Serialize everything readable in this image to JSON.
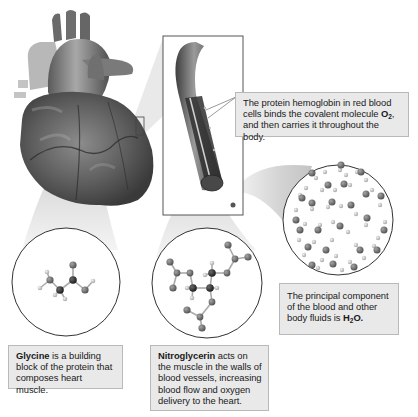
{
  "diagram": {
    "title": "",
    "illustrations": {
      "heart": "heart-illustration",
      "blood_vessel_inset": "blood-vessel-cutaway",
      "zoom_marker": "heart-zoom-marker"
    },
    "callouts": {
      "hemoglobin": {
        "line1": "The protein hemoglobin in red blood",
        "line2_pre": "cells binds the covalent molecule ",
        "molecule": "O",
        "molecule_sub": "2",
        "line2_post": ",",
        "line3": "and then carries it throughout the body."
      },
      "water": {
        "line1": "The principal component",
        "line2": "of the blood and other",
        "line3_pre": "body fluids is ",
        "molecule_a": "H",
        "molecule_sub": "2",
        "molecule_b": "O."
      },
      "glycine": {
        "term": "Glycine",
        "line1_post": " is a building",
        "line2": "block of the protein that",
        "line3": "composes heart muscle."
      },
      "nitroglycerin": {
        "term": "Nitroglycerin",
        "line1_post": " acts on",
        "line2": "the muscle in the walls of",
        "line3": "blood vessels, increasing",
        "line4": "blood flow and oxygen",
        "line5": "delivery to the heart."
      }
    },
    "molecule_views": [
      {
        "name": "glycine",
        "center": [
          66,
          282
        ],
        "radius": 54
      },
      {
        "name": "nitroglycerin",
        "center": [
          207,
          283
        ],
        "radius": 55
      },
      {
        "name": "water",
        "center": [
          338,
          220
        ],
        "radius": 55
      }
    ],
    "colors": {
      "callout_bg": "#e9e9e9",
      "callout_border": "#b9b9b9",
      "atom_dark": "#2a2a2a",
      "atom_mid": "#6d6d6d",
      "atom_light": "#c8c8c8",
      "cone": "#dcdcdc"
    }
  }
}
